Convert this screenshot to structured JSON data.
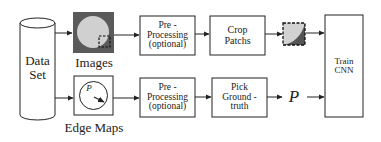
{
  "diagram": {
    "nodes": {
      "dataset": {
        "line1": "Data",
        "line2": "Set"
      },
      "images": {
        "label": "Images"
      },
      "edge_maps": {
        "label": "Edge Maps",
        "glyph": "P"
      },
      "preproc_top": {
        "line1": "Pre -",
        "line2": "Processing",
        "line3": "(optional)"
      },
      "crop": {
        "line1": "Crop",
        "line2": "Patchs"
      },
      "preproc_bottom": {
        "line1": "Pre -",
        "line2": "Processing",
        "line3": "(optional)"
      },
      "pick": {
        "line1": "Pick",
        "line2": "Ground -",
        "line3": "truth"
      },
      "p_symbol": {
        "label": "P"
      },
      "train": {
        "line1": "Train",
        "line2": "CNN"
      }
    },
    "edges": [
      {
        "from": "dataset",
        "to": "images"
      },
      {
        "from": "dataset",
        "to": "edge_maps"
      },
      {
        "from": "images",
        "to": "preproc_top"
      },
      {
        "from": "preproc_top",
        "to": "crop"
      },
      {
        "from": "crop",
        "to": "patch"
      },
      {
        "from": "patch",
        "to": "train"
      },
      {
        "from": "edge_maps",
        "to": "preproc_bottom"
      },
      {
        "from": "preproc_bottom",
        "to": "pick"
      },
      {
        "from": "pick",
        "to": "p_symbol"
      },
      {
        "from": "p_symbol",
        "to": "train"
      }
    ]
  }
}
